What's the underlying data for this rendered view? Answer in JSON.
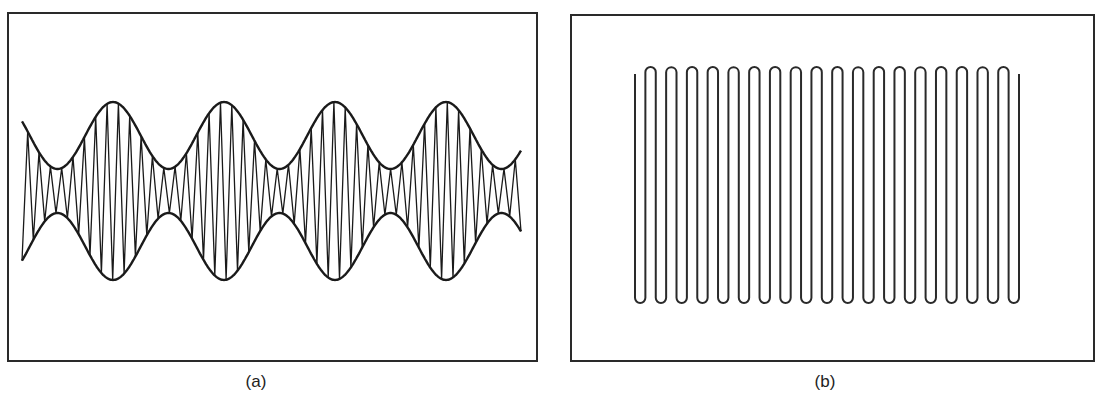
{
  "figure": {
    "panels": [
      {
        "id": "a",
        "caption": "(a)",
        "description": "Amplitude-modulated waveform (beat pattern) with envelope",
        "envelope": {
          "center_y": 191,
          "peaks_x": [
            113,
            224,
            334,
            445
          ],
          "waists_x": [
            58,
            169,
            280,
            390,
            500
          ],
          "peak_half_height": 89,
          "waist_half_height": 22,
          "x_start": 22,
          "x_end": 521
        },
        "carrier_cycles": 44,
        "stroke_color": "#1a1a1a"
      },
      {
        "id": "b",
        "caption": "(b)",
        "description": "Serpentine (meander) line pattern",
        "meander": {
          "x_start": 635,
          "x_end": 1019,
          "vertical_lines": 38,
          "top_arches": 18,
          "bottom_loops": 19,
          "top_y": 67,
          "bottom_y": 303,
          "free_end_top_y": 74
        },
        "stroke_color": "#2a2a2a"
      }
    ]
  }
}
